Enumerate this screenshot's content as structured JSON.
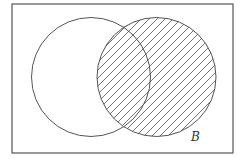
{
  "diagram": {
    "type": "venn",
    "universe": {
      "x": 12,
      "y": 4,
      "width": 221,
      "height": 149
    },
    "sets": [
      {
        "id": "A",
        "label": "",
        "cx": 91,
        "cy": 77,
        "r": 59.5,
        "shaded": false
      },
      {
        "id": "B",
        "label": "B",
        "cx": 156.5,
        "cy": 77,
        "r": 59.5,
        "shaded": true
      }
    ],
    "shading": {
      "region": "B",
      "pattern": "diagonal-hatch",
      "angle_deg": 45,
      "spacing_px": 8
    },
    "colors": {
      "stroke": "#555555",
      "hatch": "#666666",
      "background": "#ffffff",
      "label": "#333333"
    },
    "labels": {
      "B": {
        "text": "B",
        "x": 191,
        "y": 131
      }
    }
  }
}
